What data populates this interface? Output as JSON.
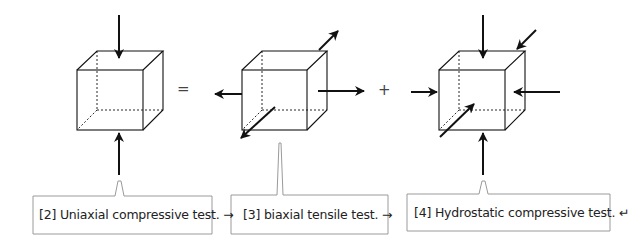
{
  "diagram": {
    "operators": {
      "equals": "=",
      "plus": "+"
    },
    "panels": [
      {
        "id": "uniaxial",
        "caption": "[2] Uniaxial compressive test. →",
        "loads": [
          "top: compressive (downward)",
          "bottom: compressive (upward)"
        ]
      },
      {
        "id": "biaxial",
        "caption": "[3] biaxial tensile test. →",
        "loads": [
          "left: tensile",
          "right: tensile",
          "back-diagonal: tensile",
          "front-diagonal: tensile"
        ]
      },
      {
        "id": "hydrostatic",
        "caption": "[4] Hydrostatic compressive test. ↵",
        "loads": [
          "top: compressive",
          "bottom: compressive",
          "left: compressive",
          "right: compressive",
          "back-diagonal: compressive",
          "front-diagonal: compressive"
        ]
      }
    ],
    "colors": {
      "line": "#111111",
      "box_border": "#9a9a9a",
      "text": "#222222"
    }
  }
}
